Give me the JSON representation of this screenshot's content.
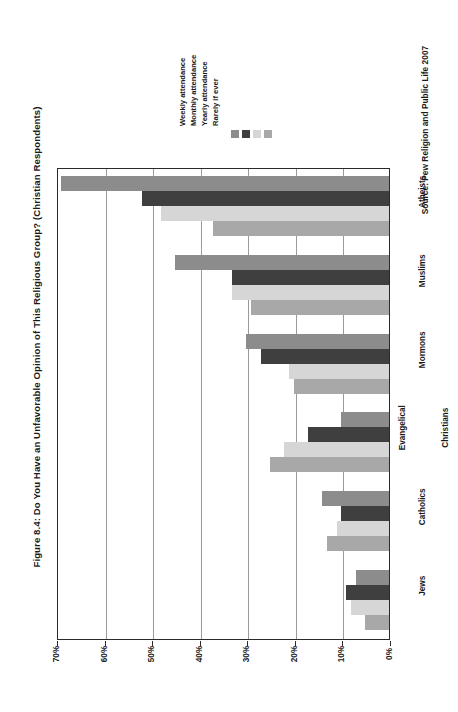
{
  "title": "Figure 8.4: Do You Have an Unfavorable Opinion of This Religious Group?  (Christian Respondents)",
  "source": "Source: Pew Religion and Public Life 2007",
  "colors": {
    "weekly": "#8c8c8c",
    "monthly": "#3f3f3f",
    "yearly": "#d6d6d6",
    "rarely": "#a8a8a8",
    "axis": "#2b2b2b",
    "grid": "#9a9a9a",
    "background": "#ffffff"
  },
  "legend": {
    "position": "top-right",
    "entries": [
      {
        "label": "Weekly attendance",
        "color_key": "weekly",
        "swatch": "legend-swatch-weekly"
      },
      {
        "label": "Monthly attendance",
        "color_key": "monthly",
        "swatch": "legend-swatch-monthly"
      },
      {
        "label": "Yearly attendance",
        "color_key": "yearly",
        "swatch": "legend-swatch-yearly"
      },
      {
        "label": "Rarely if ever",
        "color_key": "rarely",
        "swatch": "legend-swatch-rarely"
      }
    ]
  },
  "axis": {
    "tick_labels": [
      "70%",
      "60%",
      "50%",
      "40%",
      "30%",
      "20%",
      "10%",
      "0%"
    ],
    "tick_values": [
      70,
      60,
      50,
      40,
      30,
      20,
      10,
      0
    ],
    "min": 0,
    "max": 70,
    "grid": true,
    "orientation": "horizontal-bars-rotated"
  },
  "chart_data": {
    "type": "bar",
    "title": "Figure 8.4: Do You Have an Unfavorable Opinion of This Religious Group?  (Christian Respondents)",
    "subtitle": "",
    "xlabel": "",
    "ylabel": "",
    "orientation": "horizontal",
    "categories": [
      "Jews",
      "Catholics",
      "Evangelical Christians",
      "Mormons",
      "Muslims",
      "Atheists"
    ],
    "series": [
      {
        "name": "Weekly attendance",
        "values": [
          7,
          14,
          10,
          30,
          45,
          69
        ]
      },
      {
        "name": "Monthly attendance",
        "values": [
          9,
          10,
          17,
          27,
          33,
          52
        ]
      },
      {
        "name": "Yearly attendance",
        "values": [
          8,
          11,
          22,
          21,
          33,
          48
        ]
      },
      {
        "name": "Rarely if ever",
        "values": [
          5,
          13,
          25,
          20,
          29,
          37
        ]
      }
    ],
    "xlim": [
      0,
      70
    ],
    "ylim": [
      0,
      70
    ],
    "grid": true,
    "legend_position": "top-right",
    "value_unit": "%",
    "annotations": [
      "Source: Pew Religion and Public Life 2007"
    ]
  }
}
